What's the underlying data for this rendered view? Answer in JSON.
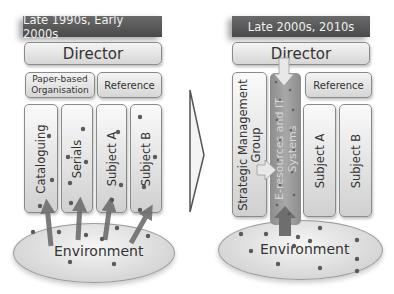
{
  "left_panel": {
    "title": "Late 1990s, Early 2000s",
    "director": "Director",
    "top_boxes": [
      "Paper-based Organisation",
      "Reference"
    ],
    "top_box_lines": [
      [
        "Paper-based",
        "Organisation"
      ],
      [
        "Reference"
      ]
    ],
    "columns": [
      "Cataloguing",
      "Serials",
      "Subject A",
      "Subject B"
    ],
    "environment": "Environment"
  },
  "transition": {
    "icon": "chevron-right-icon"
  },
  "right_panel": {
    "title": "Late 2000s, 2010s",
    "director": "Director",
    "strategic_group": [
      "Strategic Management",
      "Group"
    ],
    "eresources": [
      "E-resources and IT",
      "Systems"
    ],
    "reference": "Reference",
    "columns": [
      "Subject A",
      "Subject B"
    ],
    "environment": "Environment"
  },
  "colors": {
    "title_bg": "#555555",
    "box_bg": "#e6e6e6",
    "arrow": "#6e6e6e",
    "eresources_bg": "#9a9a9a",
    "dot": "#5a5a5a"
  }
}
